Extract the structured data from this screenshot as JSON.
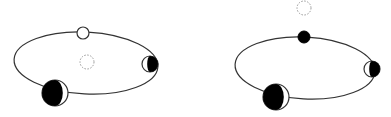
{
  "diagram": {
    "colors": {
      "stroke": "#333333",
      "fill_dark": "#000000",
      "fill_light": "#ffffff",
      "dashed": "#999999"
    },
    "panels": [
      {
        "id": "left",
        "orbit": {
          "cx": 86,
          "cy": 63,
          "rx": 72,
          "ry": 31
        },
        "center_body": {
          "cx": 87,
          "cy": 62,
          "r": 7,
          "style": "dashed"
        },
        "bodies": [
          {
            "name": "top",
            "cx": 83,
            "cy": 33,
            "r": 6,
            "phase": "full-light"
          },
          {
            "name": "right",
            "cx": 150,
            "cy": 64,
            "r": 8,
            "phase": "half-dark-right"
          },
          {
            "name": "bottom-left",
            "cx": 55,
            "cy": 93,
            "r": 13,
            "phase": "crescent-light-right"
          }
        ]
      },
      {
        "id": "right",
        "orbit": {
          "cx": 305,
          "cy": 68,
          "rx": 70,
          "ry": 31
        },
        "center_body": {
          "cx": 304,
          "cy": 8,
          "r": 7,
          "style": "dashed"
        },
        "bodies": [
          {
            "name": "top",
            "cx": 304,
            "cy": 37,
            "r": 6,
            "phase": "full-dark"
          },
          {
            "name": "right",
            "cx": 372,
            "cy": 69,
            "r": 8,
            "phase": "half-dark-right"
          },
          {
            "name": "bottom-left",
            "cx": 276,
            "cy": 97,
            "r": 13,
            "phase": "crescent-light-right"
          }
        ]
      }
    ]
  }
}
